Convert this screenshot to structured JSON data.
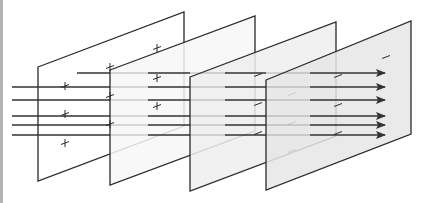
{
  "diagram": {
    "plates": [
      {
        "id": "plate-1",
        "charge_signs": [
          "+",
          "+",
          "+"
        ],
        "fill": "#ffffff"
      },
      {
        "id": "plate-2",
        "charge_signs": [
          "+",
          "+",
          "+",
          "+",
          "+",
          "+"
        ],
        "fill": "#f7f7f7"
      },
      {
        "id": "plate-3",
        "charge_signs": [
          "−",
          "−",
          "−",
          "−",
          "−",
          "−"
        ],
        "fill": "#efefef"
      },
      {
        "id": "plate-4",
        "charge_signs": [
          "−",
          "−",
          "−",
          "−"
        ],
        "fill": "#e6e6e6"
      }
    ],
    "field_line_count": 6,
    "arrow_direction": "right",
    "colors": {
      "outline": "#2a2a2a",
      "field_line": "#333333",
      "border": "#b3b3b3"
    }
  }
}
